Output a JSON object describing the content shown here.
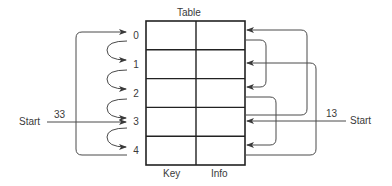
{
  "diagram": {
    "title": "Table",
    "columns": [
      {
        "label": "Key"
      },
      {
        "label": "Info"
      }
    ],
    "rows": [
      {
        "index": "0"
      },
      {
        "index": "1"
      },
      {
        "index": "2"
      },
      {
        "index": "3"
      },
      {
        "index": "4"
      }
    ],
    "left_start": {
      "label": "Start",
      "key": "33",
      "target_row": 3
    },
    "right_start": {
      "label": "Start",
      "key": "13",
      "target_row": 3
    },
    "left_probe_sequence": [
      "3",
      "4",
      "0",
      "1",
      "2"
    ],
    "left_links": [
      {
        "from": 0,
        "to": 1
      },
      {
        "from": 1,
        "to": 2
      },
      {
        "from": 2,
        "to": 3
      },
      {
        "from": 3,
        "to": 4
      },
      {
        "from": 4,
        "to": 0,
        "wrap": true
      }
    ],
    "right_links": [
      {
        "from": 0,
        "to": 2
      },
      {
        "from": 2,
        "to": 4
      },
      {
        "from": 3,
        "to": 0
      },
      {
        "from": 4,
        "to": 1
      }
    ],
    "colors": {
      "line": "#4a4a4a",
      "table_border": "#222222",
      "text": "#3a3a3a"
    }
  }
}
